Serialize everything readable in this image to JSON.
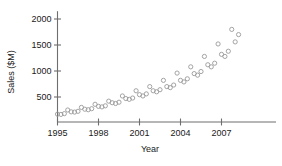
{
  "chart_data": {
    "type": "scatter",
    "title": "",
    "xlabel": "Year",
    "ylabel": "Sales ($M)",
    "xlim": [
      1994.6,
      2008.6
    ],
    "ylim": [
      0,
      2150
    ],
    "xticks": [
      1995,
      1998,
      2001,
      2004,
      2007
    ],
    "xtick_labels": [
      "1995",
      "1998",
      "2001",
      "2004",
      "2007"
    ],
    "yticks": [
      500,
      1000,
      1500,
      2000
    ],
    "ytick_labels": [
      "500",
      "1000",
      "1500",
      "2000"
    ],
    "grid": false,
    "legend": null,
    "marker": "open-circle",
    "marker_color": "#9a9a9a",
    "series": [
      {
        "name": "Quarterly sales",
        "x": [
          1995.0,
          1995.25,
          1995.5,
          1995.75,
          1996.0,
          1996.25,
          1996.5,
          1996.75,
          1997.0,
          1997.25,
          1997.5,
          1997.75,
          1998.0,
          1998.25,
          1998.5,
          1998.75,
          1999.0,
          1999.25,
          1999.5,
          1999.75,
          2000.0,
          2000.25,
          2000.5,
          2000.75,
          2001.0,
          2001.25,
          2001.5,
          2001.75,
          2002.0,
          2002.25,
          2002.5,
          2002.75,
          2003.0,
          2003.25,
          2003.5,
          2003.75,
          2004.0,
          2004.25,
          2004.5,
          2004.75,
          2005.0,
          2005.25,
          2005.5,
          2005.75,
          2006.0,
          2006.25,
          2006.5,
          2006.75,
          2007.0,
          2007.25,
          2007.5,
          2007.75,
          2008.0,
          2008.25
        ],
        "y": [
          170,
          165,
          180,
          250,
          215,
          210,
          225,
          300,
          265,
          255,
          275,
          360,
          320,
          310,
          330,
          420,
          390,
          375,
          400,
          520,
          470,
          455,
          480,
          620,
          545,
          520,
          560,
          700,
          620,
          600,
          640,
          820,
          700,
          680,
          730,
          960,
          820,
          790,
          850,
          1080,
          950,
          920,
          990,
          1280,
          1120,
          1080,
          1150,
          1520,
          1320,
          1280,
          1380,
          1800,
          1560,
          1700
        ]
      }
    ]
  },
  "axes": {
    "y_title": "Sales ($M)",
    "x_title": "Year"
  }
}
